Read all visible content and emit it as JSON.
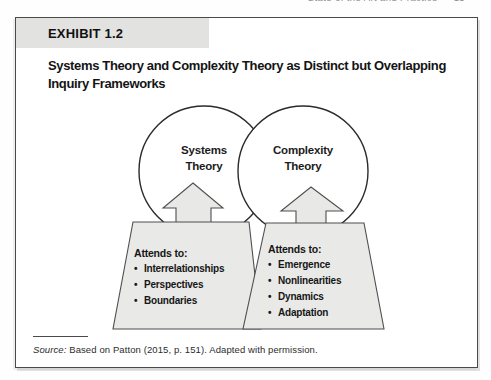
{
  "running_header": {
    "chapter_title": "State of the Art and Practice",
    "page_number": "15"
  },
  "exhibit": {
    "label": "EXHIBIT 1.2",
    "title": "Systems Theory and Complexity Theory as Distinct but Overlapping Inquiry Frameworks"
  },
  "venn": {
    "left_circle_label": "Systems\nTheory",
    "right_circle_label": "Complexity\nTheory"
  },
  "panels": {
    "bullet_char": "•",
    "left": {
      "heading": "Attends to:",
      "items": [
        "Interrelationships",
        "Perspectives",
        "Boundaries"
      ]
    },
    "right": {
      "heading": "Attends to:",
      "items": [
        "Emergence",
        "Nonlinearities",
        "Dynamics",
        "Adaptation"
      ]
    }
  },
  "source": {
    "label": "Source:",
    "text": "Based on Patton (2015, p. 151). Adapted with permission."
  },
  "colors": {
    "label_bar": "#e2e2e0",
    "shape_fill": "#e9e9e7",
    "outline": "#4f4f4f",
    "box_border": "#4a4a4a"
  }
}
